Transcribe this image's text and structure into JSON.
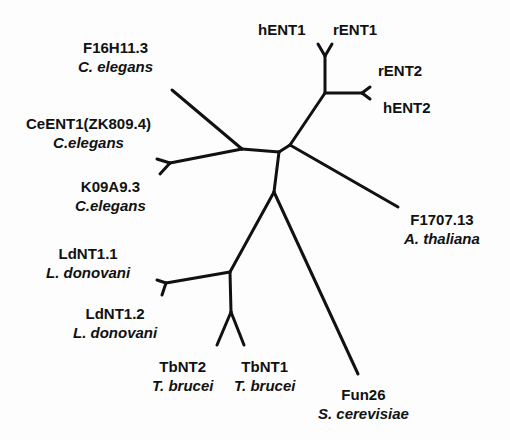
{
  "diagram": {
    "type": "unrooted phylogenetic tree",
    "line_color": "#111111",
    "background": "#fdfdfd"
  },
  "leaves": {
    "hENT1": {
      "gene": "hENT1"
    },
    "rENT1": {
      "gene": "rENT1"
    },
    "rENT2": {
      "gene": "rENT2"
    },
    "hENT2": {
      "gene": "hENT2"
    },
    "F16H11_3": {
      "gene": "F16H11.3",
      "species": "C. elegans"
    },
    "CeENT1": {
      "gene": "CeENT1(ZK809.4)",
      "species": "C.elegans"
    },
    "K09A9_3": {
      "gene": "K09A9.3",
      "species": "C.elegans"
    },
    "F1707_13": {
      "gene": "F1707.13",
      "species": "A. thaliana"
    },
    "LdNT1_1": {
      "gene": "LdNT1.1",
      "species": "L. donovani"
    },
    "LdNT1_2": {
      "gene": "LdNT1.2",
      "species": "L. donovani"
    },
    "TbNT2": {
      "gene": "TbNT2",
      "species": "T. brucei"
    },
    "TbNT1": {
      "gene": "TbNT1",
      "species": "T. brucei"
    },
    "Fun26": {
      "gene": "Fun26",
      "species": "S. cerevisiae"
    }
  },
  "clades": [
    {
      "name": "mammalian ENT",
      "members": [
        "hENT1",
        "rENT1",
        "rENT2",
        "hENT2"
      ]
    },
    {
      "name": "C. elegans",
      "members": [
        "F16H11.3",
        "CeENT1(ZK809.4)",
        "K09A9.3"
      ]
    },
    {
      "name": "plant",
      "members": [
        "F1707.13"
      ]
    },
    {
      "name": "protozoan",
      "members": [
        "LdNT1.1",
        "LdNT1.2",
        "TbNT2",
        "TbNT1"
      ]
    },
    {
      "name": "yeast",
      "members": [
        "Fun26"
      ]
    }
  ]
}
